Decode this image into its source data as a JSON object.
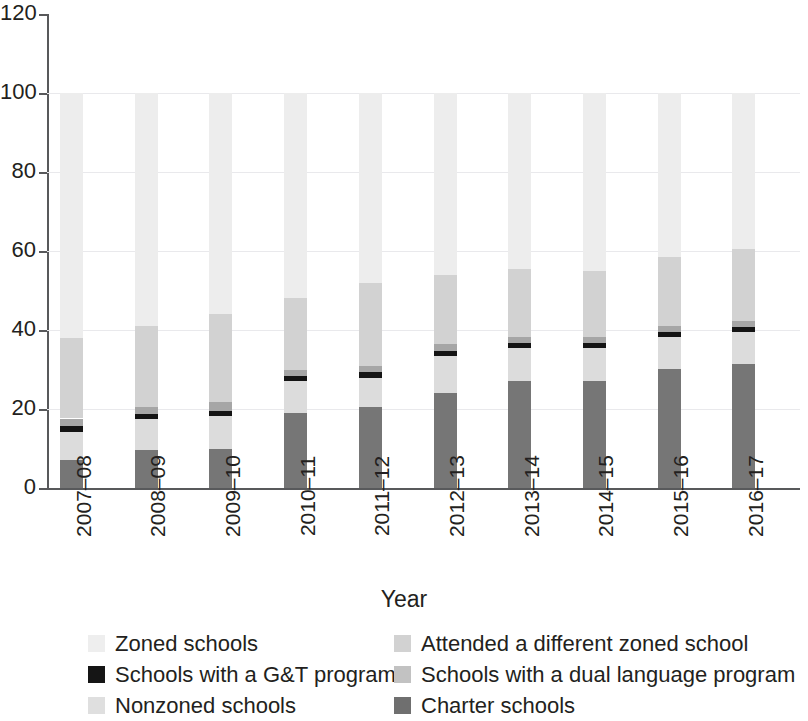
{
  "chart_data": {
    "type": "bar",
    "subtype": "stacked-bar",
    "title": "",
    "xlabel": "Year",
    "ylabel": "",
    "categories": [
      "2007–08",
      "2008–09",
      "2009–10",
      "2010–11",
      "2011–12",
      "2012–13",
      "2013–14",
      "2014–15",
      "2015–16",
      "2016–17"
    ],
    "ylim": [
      0,
      120
    ],
    "yticks": [
      0,
      20,
      40,
      60,
      80,
      100,
      120
    ],
    "ytick_labels": [
      "0",
      "20",
      "40",
      "60",
      "80",
      "100",
      "120"
    ],
    "grid": true,
    "grid_axis": "y",
    "legend_position": "bottom",
    "stack_order_bottom_to_top": [
      "Charter schools",
      "Nonzoned schools",
      "Schools with a G&T program",
      "Schools with a dual language program",
      "Attended a different zoned school",
      "Zoned schools"
    ],
    "series": [
      {
        "name": "Charter schools",
        "color": "#767676",
        "values": [
          7.0,
          9.5,
          9.8,
          19.0,
          20.5,
          24.0,
          27.0,
          27.2,
          30.2,
          31.3
        ]
      },
      {
        "name": "Nonzoned schools",
        "color": "#dcdcdc",
        "values": [
          7.3,
          8.0,
          8.5,
          8.0,
          7.3,
          9.5,
          8.5,
          8.3,
          8.0,
          8.2
        ]
      },
      {
        "name": "Schools with a G&T program",
        "color": "#141414",
        "values": [
          1.3,
          1.2,
          1.3,
          1.4,
          1.5,
          1.3,
          1.2,
          1.2,
          1.3,
          1.3
        ]
      },
      {
        "name": "Schools with a dual language program",
        "color": "#a6a6a6",
        "values": [
          2.0,
          1.8,
          2.2,
          1.6,
          1.5,
          1.7,
          1.5,
          1.5,
          1.5,
          1.5
        ]
      },
      {
        "name": "Attended a different zoned school",
        "color": "#d2d2d2",
        "values": [
          20.4,
          20.5,
          22.2,
          18.0,
          21.2,
          17.5,
          17.3,
          16.8,
          17.5,
          18.2
        ]
      },
      {
        "name": "Zoned schools",
        "color": "#ededed",
        "values": [
          62.0,
          59.0,
          56.0,
          52.0,
          48.0,
          46.0,
          44.5,
          45.0,
          41.5,
          39.5
        ]
      }
    ],
    "totals": [
      100,
      100,
      100,
      100,
      100,
      100,
      100,
      100,
      100,
      100
    ],
    "segment_tops": [
      [
        7.0,
        14.3,
        15.6,
        17.6,
        38.0,
        100.0
      ],
      [
        9.5,
        17.5,
        18.7,
        20.5,
        41.0,
        100.0
      ],
      [
        9.8,
        18.3,
        19.6,
        21.8,
        44.0,
        100.0
      ],
      [
        19.0,
        27.0,
        28.4,
        30.0,
        48.0,
        100.0
      ],
      [
        20.5,
        27.8,
        29.3,
        30.8,
        52.0,
        100.0
      ],
      [
        24.0,
        33.5,
        34.8,
        36.5,
        54.0,
        100.0
      ],
      [
        27.0,
        35.5,
        36.7,
        38.2,
        55.5,
        100.0
      ],
      [
        27.2,
        35.5,
        36.7,
        38.2,
        55.0,
        100.0
      ],
      [
        30.2,
        38.2,
        39.5,
        41.0,
        58.5,
        100.0
      ],
      [
        31.3,
        39.5,
        40.8,
        42.3,
        60.5,
        100.0
      ]
    ]
  },
  "legend": {
    "items": [
      {
        "label": "Zoned schools",
        "swatch": "zoned"
      },
      {
        "label": "Attended a different zoned school",
        "swatch": "attended"
      },
      {
        "label": "Schools with a G&T program",
        "swatch": "gt"
      },
      {
        "label": "Schools with a dual language program",
        "swatch": "dual"
      },
      {
        "label": "Nonzoned schools",
        "swatch": "nonzoned"
      },
      {
        "label": "Charter schools",
        "swatch": "charter"
      }
    ]
  }
}
